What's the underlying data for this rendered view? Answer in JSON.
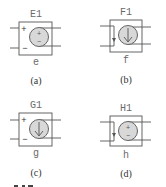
{
  "figure": {
    "panels": [
      {
        "id": "a",
        "component_name": "E1",
        "pin_label": "e",
        "caption": "(a)",
        "type": "voltage-controlled-voltage-source",
        "control": "voltage",
        "control_signs": {
          "plus": "+",
          "minus": "−"
        },
        "source_symbol": "voltage",
        "source_signs": {
          "plus": "+",
          "minus": "−"
        }
      },
      {
        "id": "b",
        "component_name": "F1",
        "pin_label": "f",
        "caption": "(b)",
        "type": "current-controlled-current-source",
        "control": "current",
        "source_symbol": "current-arrow"
      },
      {
        "id": "c",
        "component_name": "G1",
        "pin_label": "g",
        "caption": "(c)",
        "type": "voltage-controlled-current-source",
        "control": "voltage",
        "control_signs": {
          "plus": "+",
          "minus": "−"
        },
        "source_symbol": "current-arrow"
      },
      {
        "id": "d",
        "component_name": "H1",
        "pin_label": "h",
        "caption": "(d)",
        "type": "current-controlled-voltage-source",
        "control": "current",
        "source_symbol": "voltage",
        "source_signs": {
          "plus": "+",
          "minus": "−"
        }
      }
    ],
    "colors": {
      "stroke": "#555555",
      "source_fill": "#d8d8d8",
      "label_text": "#6a6a6a",
      "caption_text": "#333333"
    }
  }
}
